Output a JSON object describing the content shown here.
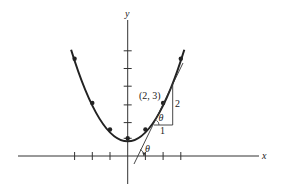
{
  "figure": {
    "axes": {
      "x_label": "x",
      "y_label": "y"
    },
    "curve": {
      "equation": "y = x^2/2 + 1",
      "marked_points": [
        [
          -3,
          5.5
        ],
        [
          -2,
          3
        ],
        [
          -1,
          1.5
        ],
        [
          0,
          1
        ],
        [
          1,
          1.5
        ],
        [
          2,
          3
        ],
        [
          3,
          5.5
        ]
      ]
    },
    "tangent": {
      "point_label": "(2, 3)",
      "slope": 2,
      "line": "y = 2x - 1"
    },
    "slope_triangle": {
      "run_label": "1",
      "rise_label": "2",
      "angle_label": "θ"
    },
    "x_intercept_angle_label": "θ",
    "ticks": {
      "x": [
        -3,
        -2,
        -1,
        1,
        2,
        3
      ],
      "y": [
        1,
        2,
        3,
        4,
        5,
        6
      ]
    },
    "colors": {
      "ink": "#222222",
      "background": "#ffffff"
    }
  }
}
